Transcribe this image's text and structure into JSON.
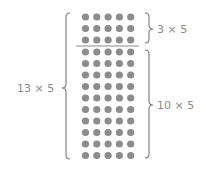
{
  "diagram": {
    "colors": {
      "dot": "#8c8c8c",
      "line": "#7a7a7a",
      "text": "#8a8a8a"
    },
    "grid": {
      "columns": 5,
      "top_rows": 3,
      "bottom_rows": 10,
      "col_x": [
        85.5,
        96.8,
        108.1,
        119.4,
        130.7
      ],
      "top_row_y": [
        17,
        28.5,
        40
      ],
      "bottom_row_y": [
        52,
        63.5,
        75,
        86.5,
        98,
        109.5,
        121,
        132.5,
        144,
        155.5
      ],
      "dot_radius": 3.6
    },
    "divider": {
      "x1": 76,
      "x2": 139,
      "y": 46
    },
    "labels": {
      "total": "13 × 5",
      "top_part": "3 × 5",
      "bottom_part": "10 × 5"
    }
  }
}
